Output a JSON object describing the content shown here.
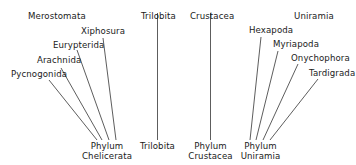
{
  "diagram": {
    "groups": [
      {
        "title": "Merostomata",
        "phylum": [
          "Phylum",
          "Chelicerata"
        ],
        "taxa": [
          "Xiphosura",
          "Eurypterida",
          "Arachnida",
          "Pycnogonida"
        ]
      },
      {
        "title": "Trilobita",
        "phylum": [
          "Trilobita"
        ],
        "taxa": []
      },
      {
        "title": "Crustacea",
        "phylum": [
          "Phylum",
          "Crustacea"
        ],
        "taxa": []
      },
      {
        "title": "Uniramia",
        "phylum": [
          "Phylum",
          "Uniramia"
        ],
        "taxa": [
          "Hexapoda",
          "Myriapoda",
          "Onychophora",
          "Tardigrada"
        ]
      }
    ],
    "line_color": "#333333"
  }
}
